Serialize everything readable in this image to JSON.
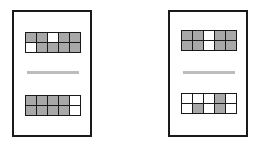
{
  "colors": {
    "frame": "#1a1a1a",
    "filled": "#a8a8a8",
    "empty": "#ffffff",
    "divider": "#bdbdbd"
  },
  "panels": [
    {
      "name": "left",
      "top_grid": [
        [
          "filled",
          "filled",
          "empty",
          "filled",
          "filled"
        ],
        [
          "empty",
          "filled",
          "filled",
          "filled",
          "filled"
        ]
      ],
      "bottom_grid": [
        [
          "filled",
          "filled",
          "filled",
          "filled",
          "empty"
        ],
        [
          "filled",
          "filled",
          "filled",
          "filled",
          "empty"
        ]
      ]
    },
    {
      "name": "right",
      "top_grid": [
        [
          "filled",
          "filled",
          "empty",
          "filled",
          "filled"
        ],
        [
          "filled",
          "filled",
          "empty",
          "filled",
          "filled"
        ]
      ],
      "bottom_grid": [
        [
          "empty",
          "empty",
          "empty",
          "filled",
          "empty"
        ],
        [
          "empty",
          "filled",
          "empty",
          "filled",
          "empty"
        ]
      ]
    }
  ]
}
